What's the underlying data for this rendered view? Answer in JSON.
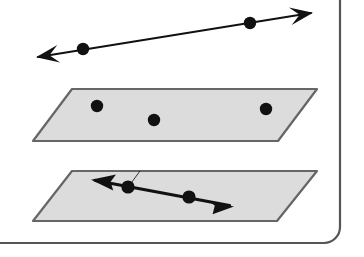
{
  "figure": {
    "canvas": {
      "width": 364,
      "height": 257,
      "background": "#ffffff"
    },
    "colors": {
      "ink": "#111111",
      "plane_fill": "#dcdcdc",
      "plane_stroke": "#666666",
      "page_border": "#555555",
      "thin_line": "#333333"
    },
    "page_frame": {
      "name": "page-corner-border",
      "description": "Rounded page edge visible along the right and bottom of the scan",
      "right_edge_x": 340,
      "bottom_edge_y": 243,
      "corner_radius": 16,
      "stroke_width": 2.2
    },
    "elements": [
      {
        "id": "top-line",
        "kind": "line",
        "label": "double-headed line above the planes",
        "from": [
          38,
          57
        ],
        "to": [
          311,
          13
        ],
        "arrow_start": true,
        "arrow_end": true,
        "stroke_width": 1.8,
        "points": [
          {
            "id": "top-line-point-1",
            "cx": 83,
            "cy": 49,
            "r": 6.2
          },
          {
            "id": "top-line-point-2",
            "cx": 250,
            "cy": 23,
            "r": 6.2
          }
        ]
      },
      {
        "id": "upper-plane",
        "kind": "plane",
        "label": "upper shaded plane with three points",
        "corners": [
          [
            72,
            89
          ],
          [
            317,
            89
          ],
          [
            278,
            141
          ],
          [
            33,
            141
          ]
        ],
        "fill": "#dcdcdc",
        "stroke": "#666666",
        "stroke_width": 2.2,
        "points": [
          {
            "id": "upper-plane-point-1",
            "cx": 97,
            "cy": 106,
            "r": 6.2
          },
          {
            "id": "upper-plane-point-2",
            "cx": 154,
            "cy": 120,
            "r": 6.2
          },
          {
            "id": "upper-plane-point-3",
            "cx": 266,
            "cy": 109,
            "r": 6.2
          }
        ]
      },
      {
        "id": "lower-plane",
        "kind": "plane",
        "label": "lower shaded plane containing a line with two points",
        "corners": [
          [
            72,
            171
          ],
          [
            317,
            171
          ],
          [
            277,
            221
          ],
          [
            33,
            221
          ]
        ],
        "fill": "#dcdcdc",
        "stroke": "#666666",
        "stroke_width": 2.2,
        "points": [
          {
            "id": "lower-plane-point-1",
            "cx": 128,
            "cy": 187,
            "r": 6.6
          },
          {
            "id": "lower-plane-point-2",
            "cx": 189,
            "cy": 197,
            "r": 6.6
          }
        ]
      },
      {
        "id": "lower-plane-line",
        "kind": "line",
        "label": "double-headed line drawn inside the lower plane",
        "from": [
          93,
          180
        ],
        "to": [
          232,
          206
        ],
        "arrow_start": true,
        "arrow_end": true,
        "stroke_width": 3.2
      },
      {
        "id": "pencil-tick",
        "kind": "tick",
        "label": "thin hand-drawn tick from the first lower point up to the plane top edge",
        "from": [
          129,
          186
        ],
        "to": [
          140,
          171
        ],
        "stroke_width": 1.0
      }
    ]
  }
}
